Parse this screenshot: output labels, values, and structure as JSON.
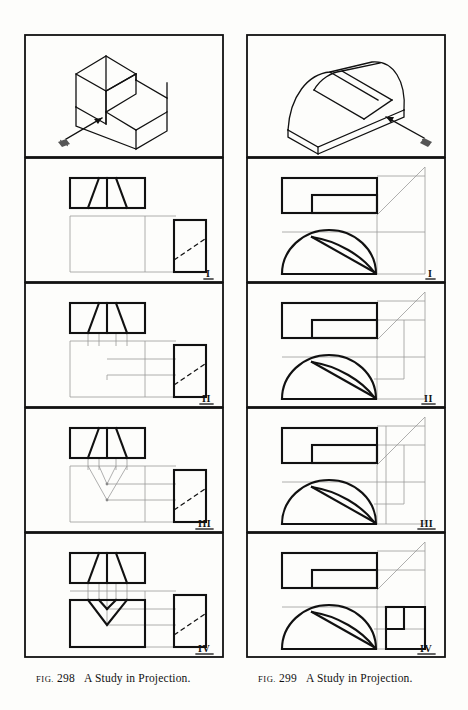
{
  "page": {
    "background": "#fdfdfb",
    "ink": "#111111",
    "construction_color": "#9a9a9a"
  },
  "figures": [
    {
      "id": "fig-298",
      "caption": {
        "prefix": "FIG.",
        "number": "298",
        "text": "A Study in Projection."
      },
      "panels": [
        {
          "label": "",
          "kind": "pictorial",
          "description": "Isometric pictorial of a rectangular block with a V-groove notch, with a viewing-direction arrow at lower left."
        },
        {
          "label": "I",
          "kind": "orthographic-step",
          "description": "Top view with V-notch edges and side view rectangle with dashed diagonal; light projection box begun."
        },
        {
          "label": "II",
          "kind": "orthographic-step",
          "description": "Vertical projectors dropped from top view points and horizontal projectors carried from side view."
        },
        {
          "label": "III",
          "kind": "orthographic-step",
          "description": "Intersections located, forming the V pattern of the notch in the front view area."
        },
        {
          "label": "IV",
          "kind": "orthographic-step",
          "description": "Front view completed, V-notch outlined in heavy object lines."
        }
      ]
    },
    {
      "id": "fig-299",
      "caption": {
        "prefix": "FIG.",
        "number": "299",
        "text": "A Study in Projection."
      },
      "panels": [
        {
          "label": "",
          "kind": "pictorial",
          "description": "Isometric pictorial of a half-round (dome) block with an inclined slot, with a viewing-direction arrow at lower right."
        },
        {
          "label": "I",
          "kind": "orthographic-step",
          "description": "Top view rectangle with inner slot rectangle, 45 degree miter line, front view semicircular dome with inclined cut line."
        },
        {
          "label": "II",
          "kind": "orthographic-step",
          "description": "Horizontal projectors carried from the top view to the miter line."
        },
        {
          "label": "III",
          "kind": "orthographic-step",
          "description": "Projectors turned at the miter line and carried down toward the side view area."
        },
        {
          "label": "IV",
          "kind": "orthographic-step",
          "description": "Side view completed showing the notched profile at the right."
        }
      ]
    }
  ]
}
